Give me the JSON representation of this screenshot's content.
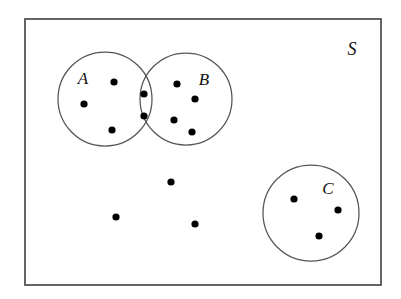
{
  "diagram": {
    "type": "venn",
    "background_color": "#ffffff",
    "dot_color": "#000000",
    "outline_color": "#555555",
    "frame_color": "#4a4a4a",
    "universe": {
      "label": "S",
      "label_x": 352,
      "label_y": 55,
      "x": 25,
      "y": 19,
      "width": 356,
      "height": 266
    },
    "sets": [
      {
        "name": "set-a",
        "label": "A",
        "cx": 105,
        "cy": 99,
        "r": 47,
        "label_x": 83,
        "label_y": 84
      },
      {
        "name": "set-b",
        "label": "B",
        "cx": 186,
        "cy": 99,
        "r": 46,
        "label_x": 204,
        "label_y": 85
      },
      {
        "name": "set-c",
        "label": "C",
        "cx": 311,
        "cy": 213,
        "r": 48,
        "label_x": 328,
        "label_y": 194
      }
    ],
    "dots": [
      {
        "region": "A-only",
        "x": 114,
        "y": 82,
        "r": 3.6
      },
      {
        "region": "A-only",
        "x": 84,
        "y": 104,
        "r": 3.6
      },
      {
        "region": "A-only",
        "x": 112,
        "y": 130,
        "r": 3.6
      },
      {
        "region": "A-and-B",
        "x": 144,
        "y": 94,
        "r": 3.6
      },
      {
        "region": "A-and-B",
        "x": 144,
        "y": 116,
        "r": 3.6
      },
      {
        "region": "B-only",
        "x": 177,
        "y": 84,
        "r": 3.6
      },
      {
        "region": "B-only",
        "x": 195,
        "y": 99,
        "r": 3.6
      },
      {
        "region": "B-only",
        "x": 174,
        "y": 120,
        "r": 3.6
      },
      {
        "region": "B-only",
        "x": 192,
        "y": 132,
        "r": 3.6
      },
      {
        "region": "S-only",
        "x": 171,
        "y": 182,
        "r": 3.6
      },
      {
        "region": "S-only",
        "x": 116,
        "y": 217,
        "r": 3.6
      },
      {
        "region": "S-only",
        "x": 195,
        "y": 224,
        "r": 3.6
      },
      {
        "region": "C-only",
        "x": 294,
        "y": 199,
        "r": 3.6
      },
      {
        "region": "C-only",
        "x": 338,
        "y": 210,
        "r": 3.6
      },
      {
        "region": "C-only",
        "x": 319,
        "y": 236,
        "r": 3.6
      }
    ],
    "counts": {
      "a_only": 3,
      "a_and_b": 2,
      "b_only": 4,
      "c_only": 3,
      "s_only": 3,
      "total": 15
    }
  }
}
